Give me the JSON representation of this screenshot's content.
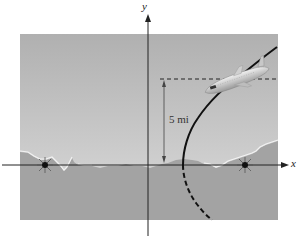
{
  "figure": {
    "type": "hyperbola-navigation-diagram",
    "axes": {
      "x_label": "x",
      "y_label": "y"
    },
    "distance_label": "5 mi",
    "colors": {
      "sky_top": "#b3b3b3",
      "sky_bottom": "#d9d9d9",
      "ground": "#a6a6a6",
      "curve": "#111111",
      "axis": "#222222"
    },
    "elements": {
      "foci": [
        {
          "name": "left-transmitter",
          "x": 45,
          "y": 165
        },
        {
          "name": "right-transmitter",
          "x": 245,
          "y": 165
        }
      ],
      "curve": {
        "shape": "hyperbola-branch",
        "solid_part": "above x-axis",
        "dashed_part": "below x-axis"
      },
      "altitude_line": {
        "style": "dashed",
        "description": "horizontal reference at plane altitude"
      },
      "aircraft": {
        "description": "airplane on hyperbola branch"
      }
    }
  }
}
